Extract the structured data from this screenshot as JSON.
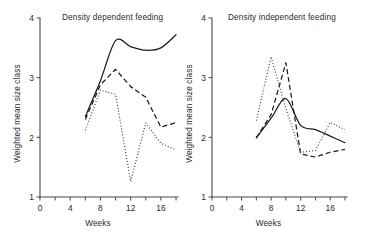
{
  "figure": {
    "background_color": "#ffffff",
    "ink_color": "#1c1c1c",
    "axis_color": "#4a4a4a"
  },
  "chart_data": [
    {
      "type": "line",
      "title": "Density dependent feeding",
      "xlabel": "Weeks",
      "ylabel": "Weighted mean size class",
      "xlim": [
        0,
        18
      ],
      "ylim": [
        1,
        4
      ],
      "grid": false,
      "legend": "none",
      "xticks": [
        0,
        2,
        4,
        6,
        8,
        10,
        12,
        14,
        16,
        18
      ],
      "xtick_labels": [
        "0",
        "",
        "4",
        "",
        "8",
        "",
        "12",
        "",
        "16",
        ""
      ],
      "yticks": [
        1,
        2,
        3,
        4
      ],
      "ytick_labels": [
        "1",
        "2",
        "3",
        "4"
      ],
      "x": [
        6,
        8,
        10,
        12,
        14,
        16,
        18
      ],
      "series": [
        {
          "name": "solid",
          "style": "solid",
          "values": [
            2.35,
            2.95,
            3.62,
            3.52,
            3.46,
            3.5,
            3.72
          ]
        },
        {
          "name": "dashed",
          "style": "dashed",
          "values": [
            2.3,
            2.88,
            3.14,
            2.85,
            2.67,
            2.17,
            2.25
          ]
        },
        {
          "name": "dotted",
          "style": "dotted",
          "values": [
            2.12,
            2.79,
            2.72,
            1.26,
            2.24,
            1.9,
            1.79
          ]
        }
      ]
    },
    {
      "type": "line",
      "title": "Density independent feeding",
      "xlabel": "Weeks",
      "ylabel": "Weighted mean size class",
      "xlim": [
        0,
        18
      ],
      "ylim": [
        1,
        4
      ],
      "grid": false,
      "legend": "none",
      "xticks": [
        0,
        2,
        4,
        6,
        8,
        10,
        12,
        14,
        16,
        18
      ],
      "xtick_labels": [
        "0",
        "",
        "4",
        "",
        "8",
        "",
        "12",
        "",
        "16",
        ""
      ],
      "yticks": [
        1,
        2,
        3,
        4
      ],
      "ytick_labels": [
        "1",
        "2",
        "3",
        "4"
      ],
      "x": [
        6,
        8,
        10,
        12,
        14,
        16,
        18
      ],
      "series": [
        {
          "name": "solid",
          "style": "solid",
          "values": [
            1.99,
            2.32,
            2.65,
            2.2,
            2.13,
            2.02,
            1.91
          ]
        },
        {
          "name": "dashed",
          "style": "dashed",
          "values": [
            1.99,
            2.38,
            3.25,
            1.72,
            1.67,
            1.75,
            1.8
          ]
        },
        {
          "name": "dotted",
          "style": "dotted",
          "values": [
            2.28,
            3.35,
            2.48,
            1.75,
            1.78,
            2.25,
            2.13
          ]
        }
      ]
    }
  ]
}
